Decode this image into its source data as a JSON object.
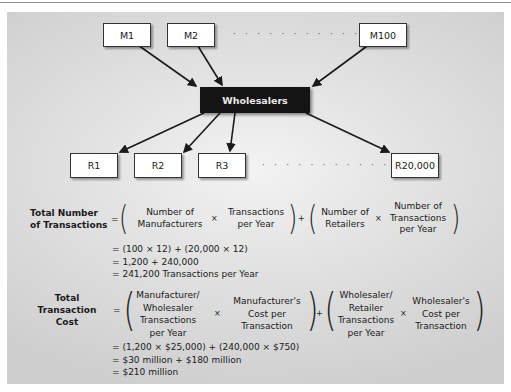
{
  "diagram": {
    "manufacturers": [
      "M1",
      "M2",
      "M100"
    ],
    "hub": "Wholesalers",
    "retailers": [
      "R1",
      "R2",
      "R3",
      "R20,000"
    ],
    "ellipsis": "· · · · · · · · · · · ·"
  },
  "formula_transactions": {
    "label_line1": "Total Number",
    "label_line2": "of Transactions",
    "equals": "=",
    "times": "×",
    "plus": "+",
    "term1_a": [
      "Number of",
      "Manufacturers"
    ],
    "term1_b": [
      "Transactions",
      "per Year"
    ],
    "term2_a": [
      "Number of",
      "Retailers"
    ],
    "term2_b": [
      "Number of",
      "Transactions",
      "per Year"
    ],
    "steps": [
      "= (100 × 12) + (20,000 × 12)",
      "= 1,200 + 240,000",
      "= 241,200 Transactions per Year"
    ]
  },
  "formula_cost": {
    "label_line1": "Total",
    "label_line2": "Transaction",
    "label_line3": "Cost",
    "equals": "=",
    "times": "×",
    "plus": "+",
    "term1_a": [
      "Manufacturer/",
      "Wholesaler",
      "Transactions",
      "per Year"
    ],
    "term1_b": [
      "Manufacturer's",
      "Cost per",
      "Transaction"
    ],
    "term2_a": [
      "Wholesaler/",
      "Retailer",
      "Transactions",
      "per Year"
    ],
    "term2_b": [
      "Wholesaler's",
      "Cost per",
      "Transaction"
    ],
    "steps": [
      "= (1,200 × $25,000) + (240,000 × $750)",
      "= $30 million + $180 million",
      "= $210 million"
    ]
  },
  "colors": {
    "hub_bg": "#141414",
    "panel_bg": "#e2e2e2",
    "arrow": "#1a1a1a"
  }
}
